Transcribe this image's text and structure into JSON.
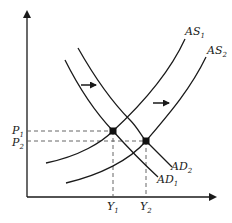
{
  "diagram": {
    "type": "AD-AS shift diagram",
    "axes": {
      "x_axis": "output",
      "y_axis": "price level"
    },
    "curves": [
      {
        "id": "AS1",
        "label": "AS",
        "subscript": "1",
        "kind": "aggregate supply"
      },
      {
        "id": "AS2",
        "label": "AS",
        "subscript": "2",
        "kind": "aggregate supply"
      },
      {
        "id": "AD1",
        "label": "AD",
        "subscript": "1",
        "kind": "aggregate demand"
      },
      {
        "id": "AD2",
        "label": "AD",
        "subscript": "2",
        "kind": "aggregate demand"
      }
    ],
    "equilibria": [
      {
        "id": "E1",
        "price": "P1",
        "output": "Y1",
        "curves": [
          "AD1",
          "AS1"
        ]
      },
      {
        "id": "E2",
        "price": "P2",
        "output": "Y2",
        "curves": [
          "AD2",
          "AS2"
        ]
      }
    ],
    "price_labels": [
      {
        "label": "P",
        "subscript": "1"
      },
      {
        "label": "P",
        "subscript": "2"
      }
    ],
    "output_labels": [
      {
        "label": "Y",
        "subscript": "1"
      },
      {
        "label": "Y",
        "subscript": "2"
      }
    ],
    "shift_arrows": [
      {
        "id": "ad-shift",
        "direction": "right"
      },
      {
        "id": "as-shift",
        "direction": "right"
      }
    ],
    "colors": {
      "line": "#1a1a1a",
      "dashed": "#555555",
      "background": "#ffffff"
    }
  }
}
